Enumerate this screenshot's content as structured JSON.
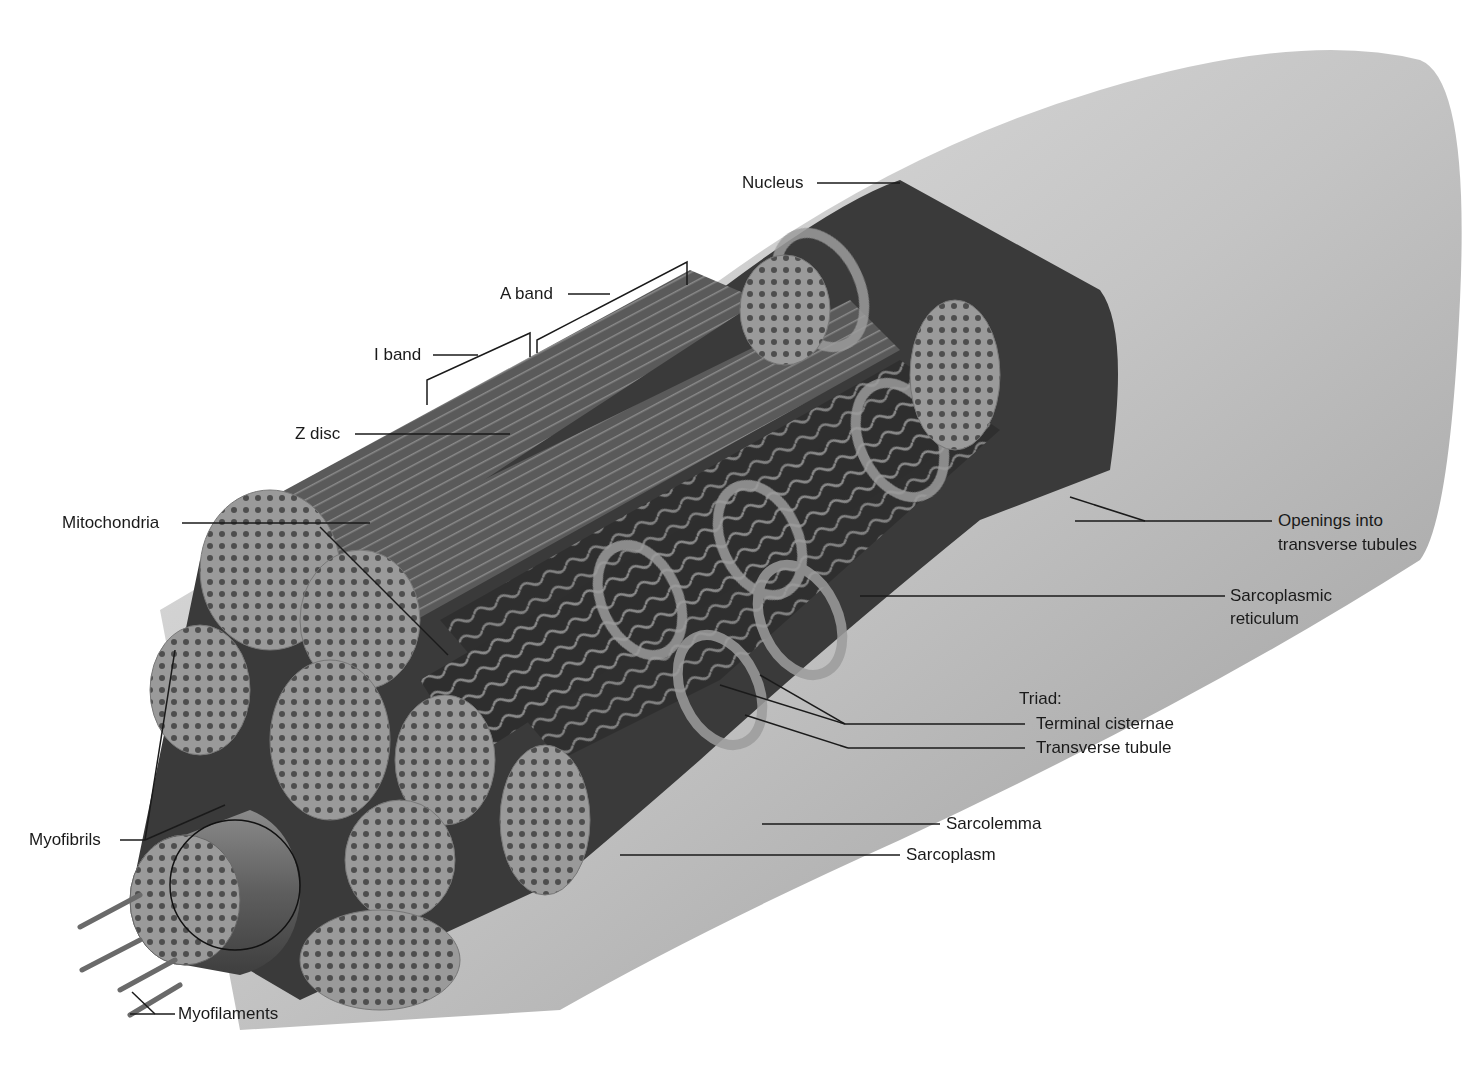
{
  "figure": {
    "labels": {
      "nucleus": "Nucleus",
      "a_band": "A band",
      "i_band": "I band",
      "z_disc": "Z disc",
      "mitochondria": "Mitochondria",
      "openings_line1": "Openings into",
      "openings_line2": "transverse tubules",
      "sr_line1": "Sarcoplasmic",
      "sr_line2": "reticulum",
      "triad": "Triad:",
      "terminal_cisternae": "Terminal cisternae",
      "transverse_tubule": "Transverse tubule",
      "sarcolemma": "Sarcolemma",
      "sarcoplasm": "Sarcoplasm",
      "myofibrils": "Myofibrils",
      "myofilaments": "Myofilaments"
    },
    "colors": {
      "background": "#ffffff",
      "fiber_surface": "#c9c9c9",
      "fiber_dark": "#5a5a5a",
      "myofibril": "#6e6e6e",
      "myofibril_face": "#8c8c8c",
      "reticulum": "#3c3c3c",
      "label_text": "#1a1a1a",
      "leader_line": "#1a1a1a"
    }
  }
}
